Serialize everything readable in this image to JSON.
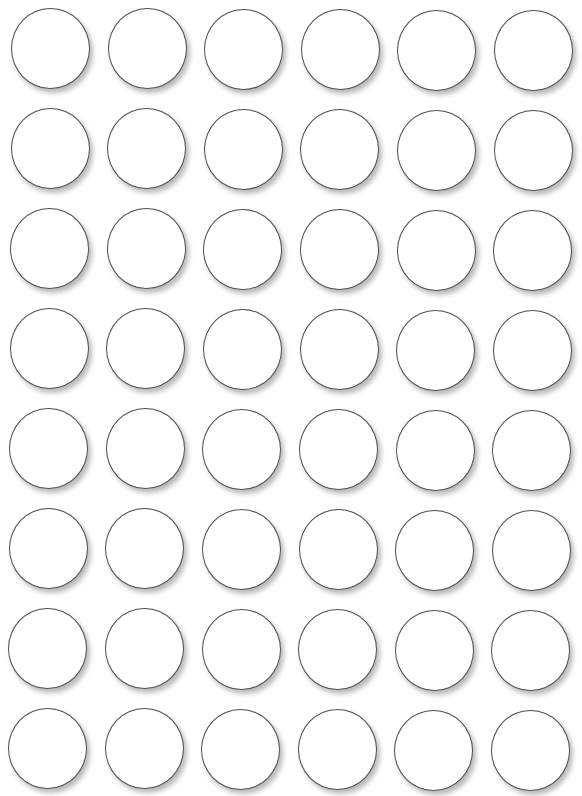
{
  "sheet": {
    "title": "",
    "background": "#ffffff",
    "rows": 8,
    "columns": 6,
    "circle": {
      "outline_color": "#4f4f4f",
      "fill_color": "#ffffff",
      "diameter_px": 80,
      "label": ""
    },
    "grid": {
      "first_row_origin": {
        "x": 11,
        "y": 8
      },
      "last_row_origin": {
        "x": 8,
        "y": 708
      },
      "col_step": 96.6,
      "row_step": 100
    }
  }
}
